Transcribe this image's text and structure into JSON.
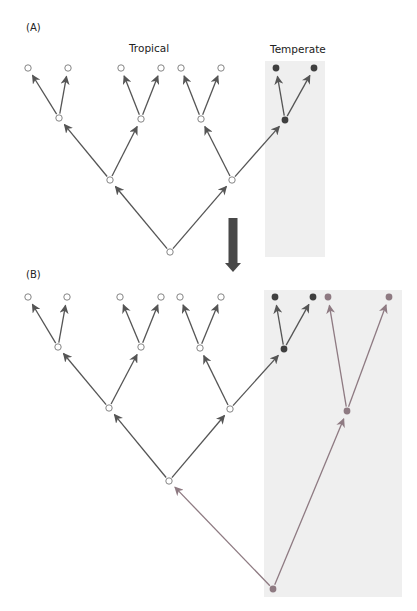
{
  "panels": {
    "a": {
      "label": "(A)",
      "region_labels": {
        "tropical": "Tropical",
        "temperate": "Temperate"
      }
    },
    "b": {
      "label": "(B)"
    }
  },
  "colors": {
    "tropical_edge": "#555555",
    "temperate_node": "#3f3f3f",
    "new_lineage": "#8e7a82",
    "shade": "#efefef",
    "transition_arrow": "#484848"
  },
  "diagram": {
    "panel_a": {
      "shaded_box": {
        "x": 265,
        "y": 61,
        "w": 60,
        "h": 196
      },
      "nodes": [
        {
          "id": "a_l1",
          "x": 28,
          "y": 68,
          "type": "open"
        },
        {
          "id": "a_l2",
          "x": 68,
          "y": 68,
          "type": "open"
        },
        {
          "id": "a_l3",
          "x": 121,
          "y": 68,
          "type": "open"
        },
        {
          "id": "a_l4",
          "x": 161,
          "y": 68,
          "type": "open"
        },
        {
          "id": "a_l5",
          "x": 181,
          "y": 68,
          "type": "open"
        },
        {
          "id": "a_l6",
          "x": 221,
          "y": 68,
          "type": "open"
        },
        {
          "id": "a_l7",
          "x": 276,
          "y": 68,
          "type": "temperate"
        },
        {
          "id": "a_l8",
          "x": 314,
          "y": 68,
          "type": "temperate"
        },
        {
          "id": "a_m1",
          "x": 59,
          "y": 118,
          "type": "open"
        },
        {
          "id": "a_m2",
          "x": 141,
          "y": 119,
          "type": "open"
        },
        {
          "id": "a_m3",
          "x": 201,
          "y": 119,
          "type": "open"
        },
        {
          "id": "a_m4",
          "x": 285,
          "y": 120,
          "type": "temperate"
        },
        {
          "id": "a_n1",
          "x": 110,
          "y": 180,
          "type": "open"
        },
        {
          "id": "a_n2",
          "x": 232,
          "y": 180,
          "type": "open"
        },
        {
          "id": "a_root",
          "x": 170,
          "y": 252,
          "type": "open"
        }
      ],
      "edges": [
        [
          "a_m1",
          "a_l1"
        ],
        [
          "a_m1",
          "a_l2"
        ],
        [
          "a_m2",
          "a_l3"
        ],
        [
          "a_m2",
          "a_l4"
        ],
        [
          "a_m3",
          "a_l5"
        ],
        [
          "a_m3",
          "a_l6"
        ],
        [
          "a_m4",
          "a_l7"
        ],
        [
          "a_m4",
          "a_l8"
        ],
        [
          "a_n1",
          "a_m1"
        ],
        [
          "a_n1",
          "a_m2"
        ],
        [
          "a_n2",
          "a_m3"
        ],
        [
          "a_n2",
          "a_m4"
        ],
        [
          "a_root",
          "a_n1"
        ],
        [
          "a_root",
          "a_n2"
        ]
      ]
    },
    "panel_b": {
      "shaded_box": {
        "x": 264,
        "y": 290,
        "w": 138,
        "h": 307
      },
      "nodes": [
        {
          "id": "b_l1",
          "x": 28,
          "y": 297,
          "type": "open"
        },
        {
          "id": "b_l2",
          "x": 67,
          "y": 297,
          "type": "open"
        },
        {
          "id": "b_l3",
          "x": 120,
          "y": 297,
          "type": "open"
        },
        {
          "id": "b_l4",
          "x": 161,
          "y": 297,
          "type": "open"
        },
        {
          "id": "b_l5",
          "x": 180,
          "y": 297,
          "type": "open"
        },
        {
          "id": "b_l6",
          "x": 221,
          "y": 297,
          "type": "open"
        },
        {
          "id": "b_l7",
          "x": 275,
          "y": 297,
          "type": "temperate"
        },
        {
          "id": "b_l8",
          "x": 313,
          "y": 297,
          "type": "temperate"
        },
        {
          "id": "b_l9",
          "x": 328,
          "y": 297,
          "type": "new"
        },
        {
          "id": "b_l10",
          "x": 389,
          "y": 297,
          "type": "new"
        },
        {
          "id": "b_m1",
          "x": 58,
          "y": 347,
          "type": "open"
        },
        {
          "id": "b_m2",
          "x": 141,
          "y": 347,
          "type": "open"
        },
        {
          "id": "b_m3",
          "x": 200,
          "y": 348,
          "type": "open"
        },
        {
          "id": "b_m4",
          "x": 284,
          "y": 349,
          "type": "temperate"
        },
        {
          "id": "b_n1",
          "x": 109,
          "y": 408,
          "type": "open"
        },
        {
          "id": "b_n2",
          "x": 230,
          "y": 409,
          "type": "open"
        },
        {
          "id": "b_new_mid",
          "x": 347,
          "y": 411,
          "type": "new"
        },
        {
          "id": "b_trop_root",
          "x": 169,
          "y": 481,
          "type": "open"
        },
        {
          "id": "b_root",
          "x": 273,
          "y": 589,
          "type": "new"
        }
      ],
      "edges": [
        [
          "b_m1",
          "b_l1",
          "dark"
        ],
        [
          "b_m1",
          "b_l2",
          "dark"
        ],
        [
          "b_m2",
          "b_l3",
          "dark"
        ],
        [
          "b_m2",
          "b_l4",
          "dark"
        ],
        [
          "b_m3",
          "b_l5",
          "dark"
        ],
        [
          "b_m3",
          "b_l6",
          "dark"
        ],
        [
          "b_m4",
          "b_l7",
          "dark"
        ],
        [
          "b_m4",
          "b_l8",
          "dark"
        ],
        [
          "b_n1",
          "b_m1",
          "dark"
        ],
        [
          "b_n1",
          "b_m2",
          "dark"
        ],
        [
          "b_n2",
          "b_m3",
          "dark"
        ],
        [
          "b_n2",
          "b_m4",
          "dark"
        ],
        [
          "b_trop_root",
          "b_n1",
          "dark"
        ],
        [
          "b_trop_root",
          "b_n2",
          "dark"
        ],
        [
          "b_new_mid",
          "b_l9",
          "new"
        ],
        [
          "b_new_mid",
          "b_l10",
          "new"
        ],
        [
          "b_root",
          "b_trop_root",
          "new"
        ],
        [
          "b_root",
          "b_new_mid",
          "new"
        ]
      ]
    },
    "transition_arrow": {
      "x": 233,
      "y1": 218,
      "y2": 272
    }
  }
}
